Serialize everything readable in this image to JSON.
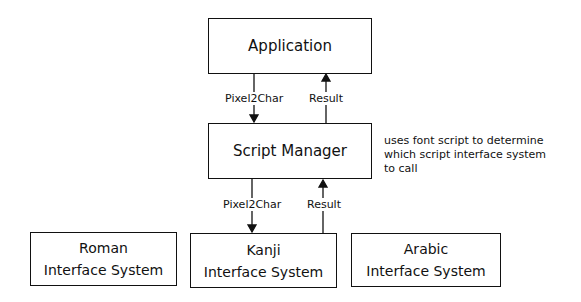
{
  "nodes": {
    "application": {
      "label": "Application"
    },
    "script_manager": {
      "label": "Script Manager"
    },
    "roman": {
      "line1": "Roman",
      "line2": "Interface System"
    },
    "kanji": {
      "line1": "Kanji",
      "line2": "Interface System"
    },
    "arabic": {
      "line1": "Arabic",
      "line2": "Interface System"
    }
  },
  "edges": {
    "app_to_sm": {
      "label": "Pixel2Char"
    },
    "sm_to_app": {
      "label": "Result"
    },
    "sm_to_kanji": {
      "label": "Pixel2Char"
    },
    "kanji_to_sm": {
      "label": "Result"
    }
  },
  "annotation": {
    "line1": "uses font script to determine",
    "line2": "which script interface system",
    "line3": "to call"
  }
}
